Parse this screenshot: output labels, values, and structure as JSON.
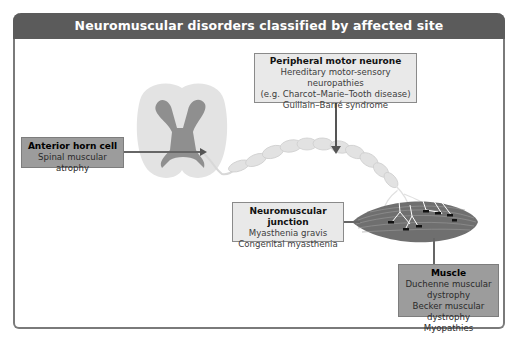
{
  "title": "Neuromuscular disorders classified by affected site",
  "colors": {
    "header_bg": "#5b5b5b",
    "frame_border": "#7a7a7a",
    "light_box": "#e9e9e9",
    "mid_box": "#9c9c9c",
    "spinal_white_matter": "#e4e4e4",
    "spinal_grey_matter": "#8f8f8f",
    "nerve": "#dcdcdc",
    "muscle": "#7a7a7a"
  },
  "sites": {
    "peripheral": {
      "title": "Peripheral motor neurone",
      "lines": [
        "Hereditary motor-sensory neuropathies",
        "(e.g. Charcot–Marie–Tooth disease)",
        "Guillain–Barré syndrome"
      ]
    },
    "anterior_horn": {
      "title": "Anterior horn cell",
      "lines": [
        "Spinal muscular atrophy"
      ]
    },
    "nmj": {
      "title": "Neuromuscular junction",
      "lines": [
        "Myasthenia gravis",
        "Congenital myasthenia"
      ]
    },
    "muscle": {
      "title": "Muscle",
      "lines": [
        "Duchenne muscular dystrophy",
        "Becker muscular dystrophy",
        "Myopathies"
      ]
    }
  },
  "illustrations": [
    "spinal-cord-cross-section",
    "myelinated-motor-nerve",
    "skeletal-muscle-with-endplates"
  ]
}
